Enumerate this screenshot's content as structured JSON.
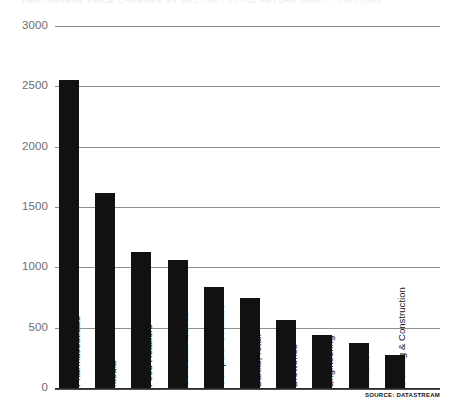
{
  "clipped_header": "PERCENTAGE PRICE CHANGES BY SECTOR  ·  TOTAL RETURN INDEX  ·  1995-2000",
  "source_note": "SOURCE: DATASTREAM",
  "axis": {
    "yticks": [
      "0",
      "500",
      "1000",
      "1500",
      "2000",
      "2500",
      "3000"
    ]
  },
  "colors": {
    "bar": "#111111",
    "gridline": "#8f8f8f",
    "baseline": "#2b2b2b",
    "tick_text": "#6e6e6e",
    "label_text": "#141414",
    "background": "#ffffff"
  },
  "chart_data": {
    "type": "bar",
    "title": "",
    "subtitle": "",
    "xlabel": "",
    "ylabel": "",
    "ylim": [
      0,
      3000
    ],
    "ytick_values": [
      0,
      500,
      1000,
      1500,
      2000,
      2500,
      3000
    ],
    "grid": true,
    "legend": false,
    "orientation": "vertical",
    "categories": [
      "Pharmaceuticals",
      "Media",
      "Food Retailers",
      "Consumer Goods",
      "Computer Software",
      "Banks, retail",
      "Breweries",
      "Engineering",
      "Textiles",
      "Building & Construction"
    ],
    "values": [
      2550,
      1620,
      1130,
      1060,
      840,
      750,
      560,
      440,
      370,
      270
    ],
    "source": "DATASTREAM"
  }
}
